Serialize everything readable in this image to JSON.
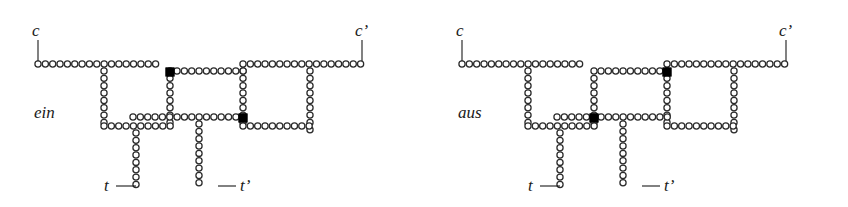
{
  "figure": {
    "caption_labels": [
      "ein",
      "aus"
    ],
    "bead_radius": 3.1,
    "bead_pitch": 7.35,
    "colors": {
      "bead_fill": "#ffffff",
      "bead_stroke": "#2b2b2b",
      "switch_fill": "#000000",
      "label_color": "#1a1a1a",
      "background": "#ffffff"
    }
  },
  "panels": [
    {
      "id": "ein",
      "state_label": "ein",
      "state_label_pos": {
        "x": 34,
        "y": 118
      },
      "terminals": [
        {
          "name": "c",
          "label": "c",
          "label_x": 32,
          "label_y": 36,
          "lead": {
            "x1": 38,
            "y1": 40,
            "x2": 38,
            "y2": 61
          }
        },
        {
          "name": "cp",
          "label": "c’",
          "label_x": 355,
          "label_y": 36,
          "lead": {
            "x1": 362,
            "y1": 40,
            "x2": 362,
            "y2": 61
          }
        },
        {
          "name": "t",
          "label": "t",
          "label_x": 104,
          "label_y": 191,
          "lead": {
            "x1": 116,
            "y1": 186,
            "x2": 136,
            "y2": 186
          }
        },
        {
          "name": "tp",
          "label": "t’",
          "label_x": 240,
          "label_y": 191,
          "lead": {
            "x1": 218,
            "y1": 186,
            "x2": 236,
            "y2": 186
          }
        }
      ],
      "segments": [
        {
          "name": "top-left-rail",
          "orient": "h",
          "x": 38,
          "y": 64,
          "count": 17
        },
        {
          "name": "top-right-rail",
          "orient": "h",
          "x": 243,
          "y": 64,
          "count": 17
        },
        {
          "name": "left-vertical-stem",
          "orient": "v",
          "x": 104,
          "y": 71,
          "count": 8
        },
        {
          "name": "mid-vertical-stem",
          "orient": "v",
          "x": 170,
          "y": 71,
          "count": 8
        },
        {
          "name": "right-vertical-stem",
          "orient": "v",
          "x": 243,
          "y": 71,
          "count": 8
        },
        {
          "name": "far-right-stem",
          "orient": "v",
          "x": 310,
          "y": 71,
          "count": 9
        },
        {
          "name": "upper-cross-rail",
          "orient": "h",
          "x": 177,
          "y": 71,
          "count": 10
        },
        {
          "name": "lower-mid-rail",
          "orient": "h",
          "x": 133,
          "y": 117,
          "count": 16
        },
        {
          "name": "bottom-left-rail",
          "orient": "h",
          "x": 104,
          "y": 126,
          "count": 10
        },
        {
          "name": "bottom-right-rail",
          "orient": "h",
          "x": 243,
          "y": 126,
          "count": 10
        },
        {
          "name": "t-drop",
          "orient": "v",
          "x": 136,
          "y": 133,
          "count": 8
        },
        {
          "name": "tp-drop",
          "orient": "v",
          "x": 199,
          "y": 124,
          "count": 9
        }
      ],
      "switches": [
        {
          "name": "switch-upper",
          "x": 170,
          "y": 72,
          "size": 8.6
        },
        {
          "name": "switch-lower",
          "x": 243,
          "y": 118,
          "size": 8.6
        }
      ]
    },
    {
      "id": "aus",
      "state_label": "aus",
      "state_label_pos": {
        "x": 34,
        "y": 118
      },
      "terminals": [
        {
          "name": "c",
          "label": "c",
          "label_x": 32,
          "label_y": 36,
          "lead": {
            "x1": 38,
            "y1": 40,
            "x2": 38,
            "y2": 61
          }
        },
        {
          "name": "cp",
          "label": "c’",
          "label_x": 355,
          "label_y": 36,
          "lead": {
            "x1": 362,
            "y1": 40,
            "x2": 362,
            "y2": 61
          }
        },
        {
          "name": "t",
          "label": "t",
          "label_x": 104,
          "label_y": 191,
          "lead": {
            "x1": 116,
            "y1": 186,
            "x2": 136,
            "y2": 186
          }
        },
        {
          "name": "tp",
          "label": "t’",
          "label_x": 240,
          "label_y": 191,
          "lead": {
            "x1": 218,
            "y1": 186,
            "x2": 236,
            "y2": 186
          }
        }
      ],
      "segments": [
        {
          "name": "top-left-rail",
          "orient": "h",
          "x": 38,
          "y": 64,
          "count": 17
        },
        {
          "name": "top-right-rail",
          "orient": "h",
          "x": 243,
          "y": 64,
          "count": 17
        },
        {
          "name": "left-vertical-stem",
          "orient": "v",
          "x": 104,
          "y": 71,
          "count": 8
        },
        {
          "name": "mid-vertical-stem",
          "orient": "v",
          "x": 170,
          "y": 71,
          "count": 8
        },
        {
          "name": "right-vertical-stem",
          "orient": "v",
          "x": 243,
          "y": 71,
          "count": 8
        },
        {
          "name": "far-right-stem",
          "orient": "v",
          "x": 310,
          "y": 71,
          "count": 9
        },
        {
          "name": "upper-cross-rail",
          "orient": "h",
          "x": 177,
          "y": 71,
          "count": 10
        },
        {
          "name": "lower-mid-rail",
          "orient": "h",
          "x": 133,
          "y": 117,
          "count": 16
        },
        {
          "name": "bottom-left-rail",
          "orient": "h",
          "x": 104,
          "y": 126,
          "count": 10
        },
        {
          "name": "bottom-right-rail",
          "orient": "h",
          "x": 243,
          "y": 126,
          "count": 10
        },
        {
          "name": "t-drop",
          "orient": "v",
          "x": 136,
          "y": 133,
          "count": 8
        },
        {
          "name": "tp-drop",
          "orient": "v",
          "x": 199,
          "y": 124,
          "count": 9
        }
      ],
      "switches": [
        {
          "name": "switch-upper",
          "x": 243,
          "y": 72,
          "size": 8.6
        },
        {
          "name": "switch-lower",
          "x": 170,
          "y": 118,
          "size": 8.6
        }
      ]
    }
  ]
}
